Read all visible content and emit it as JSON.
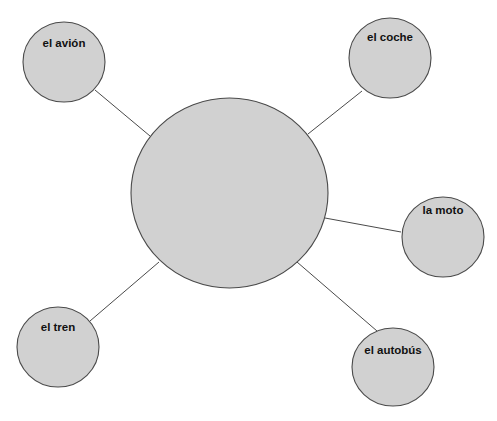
{
  "diagram": {
    "type": "spider-map",
    "colors": {
      "fill": "#d1d1d1",
      "stroke": "#4a4a4a",
      "line": "#4a4a4a",
      "text": "#111111",
      "background": "#ffffff"
    },
    "center": {
      "label": "",
      "cx": 229.5,
      "cy": 193,
      "rx": 98.5,
      "ry": 95
    },
    "nodes": [
      {
        "id": "avion",
        "label": "el avión",
        "cx": 64,
        "cy": 62,
        "rx": 41,
        "ry": 40,
        "label_y": 38,
        "line": [
          95,
          90,
          150,
          136
        ]
      },
      {
        "id": "coche",
        "label": "el coche",
        "cx": 390,
        "cy": 58,
        "rx": 41,
        "ry": 40,
        "label_y": 32,
        "line": [
          362,
          91,
          308,
          134
        ]
      },
      {
        "id": "moto",
        "label": "la moto",
        "cx": 443,
        "cy": 237,
        "rx": 41,
        "ry": 40,
        "label_y": 205,
        "line": [
          325,
          218,
          401,
          232
        ]
      },
      {
        "id": "tren",
        "label": "el tren",
        "cx": 58,
        "cy": 347,
        "rx": 41,
        "ry": 40,
        "label_y": 322,
        "line": [
          90,
          321,
          159,
          262
        ]
      },
      {
        "id": "autobus",
        "label": "el autobús",
        "cx": 393,
        "cy": 367,
        "rx": 41,
        "ry": 39,
        "label_y": 345,
        "line": [
          297,
          262,
          377,
          331
        ]
      }
    ]
  }
}
